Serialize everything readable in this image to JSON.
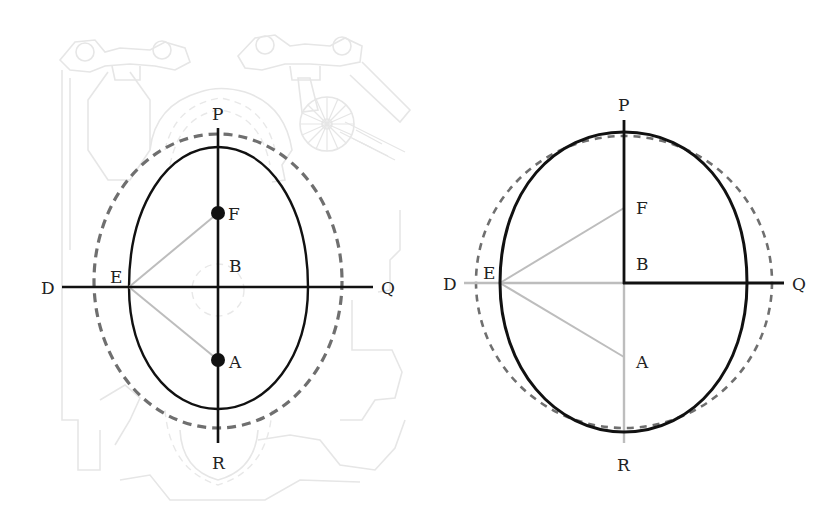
{
  "colors": {
    "background": "#ffffff",
    "solid_line": "#111111",
    "dashed_line": "#6f6f6f",
    "construction_line": "#bdbdbd",
    "watermark": "#e6e6e6",
    "label": "#222222"
  },
  "left_diagram": {
    "labels": {
      "P": "P",
      "F": "F",
      "B": "B",
      "D": "D",
      "E": "E",
      "Q": "Q",
      "A": "A",
      "R": "R"
    },
    "description": "Oval (egg-shaped ellipse) with foci F and A on vertical axis PR, horizontal axis DQ through B, dashed outer circle, construction lines from E to F and A"
  },
  "right_diagram": {
    "labels": {
      "P": "P",
      "F": "F",
      "B": "B",
      "D": "D",
      "E": "E",
      "Q": "Q",
      "A": "A",
      "R": "R"
    },
    "description": "Oval overlaid on dashed circle; half-axes BP and BQ drawn solid black, BD and BR in light gray, gray construction lines from E to F and A"
  }
}
